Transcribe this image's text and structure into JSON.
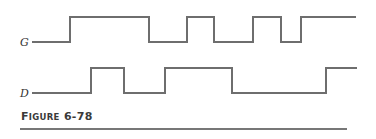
{
  "figure": {
    "caption_first_letter": "F",
    "caption_rest_smallcaps": "IGURE",
    "caption_number": "6-78",
    "caption_full": "FIGURE 6-78"
  },
  "colors": {
    "waveform": "#6e6e6e",
    "text": "#333333",
    "rule": "#777777"
  },
  "signals": [
    {
      "name": "G",
      "label_pos": {
        "x": 20,
        "y": 46
      },
      "high_y": 17,
      "low_y": 42,
      "start_x": 32,
      "end_x": 356,
      "initial_level": "low",
      "transitions_x": [
        70,
        149,
        187,
        214,
        253,
        281,
        301
      ],
      "path": "M32,42 H70 V17 H149 V42 H187 V17 H214 V42 H253 V17 H281 V42 H301 V17 H356"
    },
    {
      "name": "D",
      "label_pos": {
        "x": 20,
        "y": 97
      },
      "high_y": 68,
      "low_y": 93,
      "start_x": 32,
      "end_x": 357,
      "initial_level": "low",
      "transitions_x": [
        91,
        124,
        165,
        232,
        326
      ],
      "path": "M32,93 H91 V68 H124 V93 H165 V68 H232 V93 H326 V68 H357"
    }
  ]
}
